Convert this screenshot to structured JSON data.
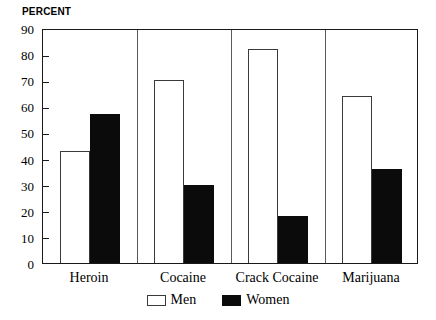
{
  "chart_data": {
    "type": "bar",
    "title": "",
    "ylabel": "PERCENT",
    "xlabel": "",
    "categories": [
      "Heroin",
      "Cocaine",
      "Crack Cocaine",
      "Marijuana"
    ],
    "series": [
      {
        "name": "Men",
        "values": [
          43,
          70,
          82,
          64
        ],
        "color": "#ffffff"
      },
      {
        "name": "Women",
        "values": [
          57,
          30,
          18,
          36
        ],
        "color": "#000000"
      }
    ],
    "ylim": [
      0,
      90
    ],
    "ytick_step": 10,
    "yticks": [
      90,
      80,
      70,
      60,
      50,
      40,
      30,
      20,
      10,
      0
    ],
    "ytick_labels": [
      "90",
      "80",
      "70",
      "60",
      "50",
      "40",
      "30",
      "20",
      "10",
      "0"
    ],
    "grid": false,
    "tick_direction": "inward",
    "legend_position": "bottom-center",
    "legend_entries": [
      "Men",
      "Women"
    ],
    "frame": "box"
  }
}
